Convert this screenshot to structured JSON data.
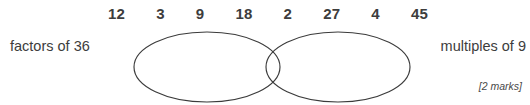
{
  "question": {
    "numbers": [
      "12",
      "3",
      "9",
      "18",
      "2",
      "27",
      "4",
      "45"
    ],
    "left_set_label": "factors of 36",
    "right_set_label": "multiples of 9",
    "marks_note": "[2 marks]"
  },
  "diagram": {
    "type": "venn-two-set",
    "stroke_color": "#3b3b3b",
    "text_color": "#3d3d3d",
    "background_color": "#ffffff",
    "left_ellipse": {
      "cx": 207,
      "cy": 67,
      "rx": 73,
      "ry": 35
    },
    "right_ellipse": {
      "cx": 338,
      "cy": 67,
      "rx": 72,
      "ry": 35
    }
  }
}
